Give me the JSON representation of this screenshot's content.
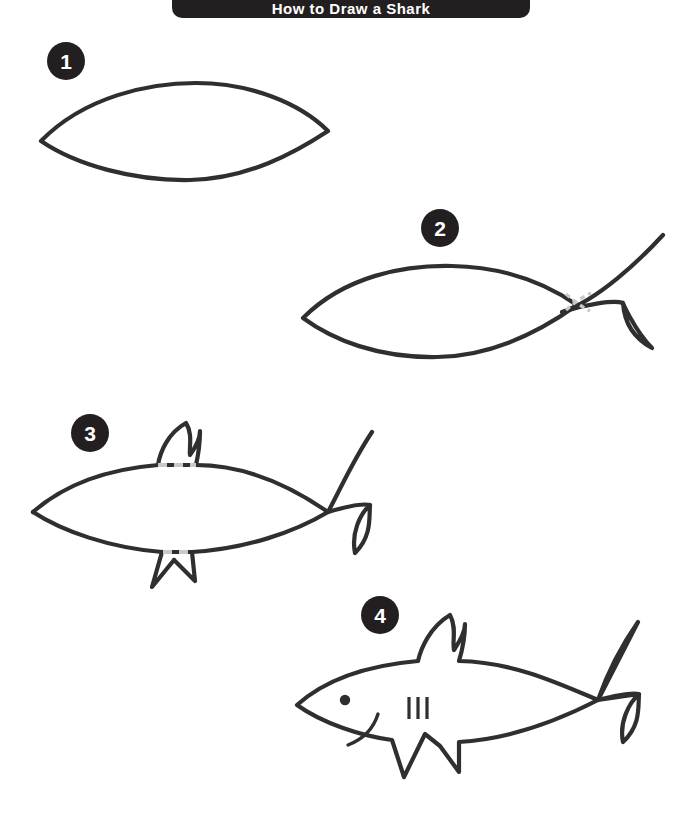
{
  "page": {
    "title": "How to Draw a Shark",
    "background_color": "#ffffff",
    "ink_color": "#2f2f2f",
    "guide_color": "#c9c9c9",
    "badge_color": "#231f20",
    "badge_text_color": "#ffffff",
    "width": 678,
    "height": 818
  },
  "header": {
    "label": "How to Draw a Shark",
    "bar_color": "#231f20"
  },
  "steps": [
    {
      "number": "1",
      "name": "body-outline",
      "description": "Draw a pointed oval (lens shape) for the shark body.",
      "badge": {
        "x": 66,
        "y": 61,
        "r": 19
      },
      "parts": [
        "body-lens"
      ],
      "guides": []
    },
    {
      "number": "2",
      "name": "tail-fin",
      "description": "Add the forked tail fin at the right end of the body.",
      "badge": {
        "x": 440,
        "y": 228,
        "r": 19
      },
      "parts": [
        "body-lens",
        "tail-fin"
      ],
      "guides": [
        "tail-overlap-dashes"
      ]
    },
    {
      "number": "3",
      "name": "dorsal-and-belly-fins",
      "description": "Add the dorsal fin on top and two fins underneath.",
      "badge": {
        "x": 90,
        "y": 433,
        "r": 19
      },
      "parts": [
        "body-lens",
        "tail-fin",
        "dorsal-fin",
        "pectoral-fin",
        "pelvic-fin"
      ],
      "guides": [
        "dorsal-base-dashes",
        "belly-base-dashes"
      ]
    },
    {
      "number": "4",
      "name": "finished-shark",
      "description": "Finish with the eye, mouth and three gill slits.",
      "badge": {
        "x": 380,
        "y": 615,
        "r": 19
      },
      "parts": [
        "shark-outline",
        "eye-dot",
        "mouth-curve",
        "gill-slits"
      ],
      "guides": []
    }
  ],
  "details": {
    "eye": {
      "label": "eye-dot",
      "cx": 345,
      "cy": 700,
      "r": 5
    },
    "gill_slit_count": 3,
    "mouth": {
      "label": "mouth-curve"
    }
  }
}
